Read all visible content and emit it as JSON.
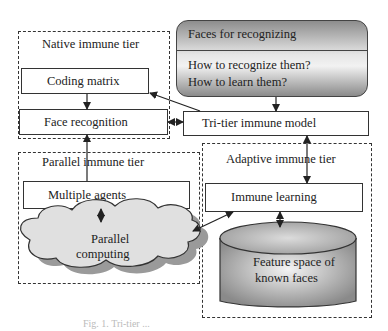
{
  "diagram": {
    "native_tier": {
      "title": "Native immune tier",
      "coding_matrix": "Coding matrix",
      "face_recognition": "Face recognition"
    },
    "faces_panel": {
      "title": "Faces for recognizing",
      "question_1": "How to recognize them?",
      "question_2": "How to learn them?"
    },
    "tri_tier_model": "Tri-tier immune model",
    "parallel_tier": {
      "title": "Parallel immune tier",
      "multiple_agents": "Multiple agents",
      "cloud_line_1": "Parallel",
      "cloud_line_2": "computing"
    },
    "adaptive_tier": {
      "title": "Adaptive immune tier",
      "immune_learning": "Immune learning",
      "db_line_1": "Feature space of",
      "db_line_2": "known faces"
    },
    "caption": "Fig. 1. Tri-tier ..."
  }
}
